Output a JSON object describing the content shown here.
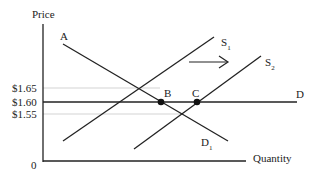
{
  "diagram": {
    "type": "supply-demand",
    "axes": {
      "y_label": "Price",
      "x_label": "Quantity",
      "origin_label": "0"
    },
    "price_ticks": [
      {
        "label": "$1.65",
        "y": 88
      },
      {
        "label": "$1.60",
        "y": 102
      },
      {
        "label": "$1.55",
        "y": 114
      }
    ],
    "curves": {
      "demand_original_label": "A",
      "demand_original_end_label": "D",
      "demand_new_label": "D",
      "demand_new_sub": "1",
      "supply1_label": "S",
      "supply1_sub": "1",
      "supply2_label": "S",
      "supply2_sub": "2"
    },
    "points": {
      "b_label": "B",
      "c_label": "C"
    },
    "arrow": "shift right",
    "colors": {
      "line": "#222222",
      "guide": "#bbbbbb"
    }
  }
}
